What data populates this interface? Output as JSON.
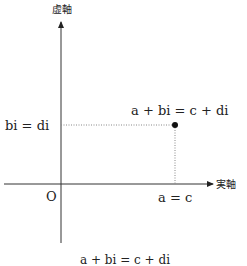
{
  "diagram": {
    "axes": {
      "imaginary_label": "虚軸",
      "real_label": "実軸",
      "origin_label": "O"
    },
    "point": {
      "label": "a + bi = c + di",
      "x_label": "a = c",
      "y_label": "bi = di"
    },
    "caption": "a + bi = c + di",
    "colors": {
      "axis": "#333333",
      "guide": "#777777",
      "point": "#111111"
    }
  }
}
